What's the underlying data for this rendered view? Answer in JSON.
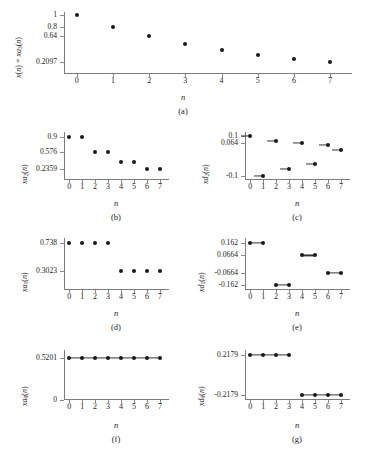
{
  "figure": {
    "xlabel": "n",
    "xticks": [
      "0",
      "1",
      "2",
      "3",
      "4",
      "5",
      "6",
      "7"
    ],
    "dot_color": "#1a1a1a",
    "axis_color": "#7d7d7d"
  },
  "chart_data": [
    {
      "id": "a",
      "type": "scatter",
      "caption": "(a)",
      "title": "",
      "xlabel": "n",
      "ylabel": "x(n) = xa3(n)",
      "ylabel_parts": [
        "x",
        "(",
        "n",
        ") = ",
        "xa",
        "3",
        "(",
        "n",
        ")"
      ],
      "yticks": [
        "1",
        "0.8",
        "0.64",
        "0.2097"
      ],
      "ytickvals": [
        1,
        0.8,
        0.64,
        0.2097
      ],
      "x": [
        0,
        1,
        2,
        3,
        4,
        5,
        6,
        7
      ],
      "values": [
        1,
        0.8,
        0.64,
        0.512,
        0.4096,
        0.3277,
        0.2621,
        0.2097
      ],
      "ylim": [
        0,
        1.05
      ],
      "xlim": [
        -0.35,
        7.6
      ],
      "grid": false,
      "markers": "dots",
      "legend": "none"
    },
    {
      "id": "b",
      "type": "scatter",
      "caption": "(b)",
      "xlabel": "n",
      "ylabel": "xa2(n)",
      "yticks": [
        "0.9",
        "0.576",
        "0.2359"
      ],
      "ytickvals": [
        0.9,
        0.576,
        0.2359
      ],
      "x": [
        0,
        1,
        2,
        3,
        4,
        5,
        6,
        7
      ],
      "values": [
        0.9,
        0.9,
        0.576,
        0.576,
        0.368,
        0.368,
        0.2359,
        0.2359
      ],
      "ylim": [
        0,
        1.0
      ],
      "xlim": [
        -0.4,
        7.7
      ],
      "grid": false,
      "markers": "dots",
      "legend": "none"
    },
    {
      "id": "c",
      "type": "scatter",
      "caption": "(c)",
      "xlabel": "n",
      "ylabel": "xd2(n)",
      "yticks": [
        "0.1",
        "0.064",
        "-0.1"
      ],
      "ytickvals": [
        0.1,
        0.064,
        -0.1
      ],
      "x": [
        0,
        1,
        2,
        3,
        4,
        5,
        6,
        7
      ],
      "values": [
        0.1,
        -0.1,
        0.077,
        -0.066,
        0.064,
        -0.04,
        0.057,
        0.028
      ],
      "ylim": [
        -0.12,
        0.12
      ],
      "xlim": [
        -0.4,
        7.7
      ],
      "grid": false,
      "markers": "dots-with-tail",
      "legend": "none"
    },
    {
      "id": "d",
      "type": "scatter",
      "caption": "(d)",
      "xlabel": "n",
      "ylabel": "xa1(n)",
      "yticks": [
        "0.738",
        "0.3023"
      ],
      "ytickvals": [
        0.738,
        0.3023
      ],
      "x": [
        0,
        1,
        2,
        3,
        4,
        5,
        6,
        7
      ],
      "values": [
        0.738,
        0.738,
        0.738,
        0.738,
        0.3023,
        0.3023,
        0.3023,
        0.3023
      ],
      "ylim": [
        0,
        0.82
      ],
      "xlim": [
        -0.4,
        7.7
      ],
      "grid": false,
      "markers": "dots",
      "legend": "none"
    },
    {
      "id": "e",
      "type": "scatter",
      "caption": "(e)",
      "xlabel": "n",
      "ylabel": "xd1(n)",
      "yticks": [
        "0.162",
        "0.0664",
        "-0.0664",
        "-0.162"
      ],
      "ytickvals": [
        0.162,
        0.0664,
        -0.0664,
        -0.162
      ],
      "x": [
        0,
        1,
        2,
        3,
        4,
        5,
        6,
        7
      ],
      "values": [
        0.162,
        0.162,
        -0.162,
        -0.162,
        0.0664,
        0.0664,
        -0.0664,
        -0.0664
      ],
      "ylim": [
        -0.2,
        0.2
      ],
      "xlim": [
        -0.4,
        7.7
      ],
      "grid": false,
      "markers": "dots-connected-pairs",
      "legend": "none"
    },
    {
      "id": "f",
      "type": "scatter",
      "caption": "(f)",
      "xlabel": "n",
      "ylabel": "xa0(n)",
      "yticks": [
        "0.5201",
        "0"
      ],
      "ytickvals": [
        0.5201,
        0
      ],
      "x": [
        0,
        1,
        2,
        3,
        4,
        5,
        6,
        7
      ],
      "values": [
        0.5201,
        0.5201,
        0.5201,
        0.5201,
        0.5201,
        0.5201,
        0.5201,
        0.5201
      ],
      "ylim": [
        0,
        0.62
      ],
      "xlim": [
        -0.4,
        7.7
      ],
      "grid": false,
      "markers": "dots-connected",
      "legend": "none"
    },
    {
      "id": "g",
      "type": "scatter",
      "caption": "(g)",
      "xlabel": "n",
      "ylabel": "xd0(n)",
      "yticks": [
        "0.2179",
        "-0.2179"
      ],
      "ytickvals": [
        0.2179,
        -0.2179
      ],
      "x": [
        0,
        1,
        2,
        3,
        4,
        5,
        6,
        7
      ],
      "values": [
        0.2179,
        0.2179,
        0.2179,
        0.2179,
        -0.2179,
        -0.2179,
        -0.2179,
        -0.2179
      ],
      "ylim": [
        -0.27,
        0.27
      ],
      "xlim": [
        -0.4,
        7.7
      ],
      "grid": false,
      "markers": "dots-connected-groups",
      "legend": "none"
    }
  ]
}
